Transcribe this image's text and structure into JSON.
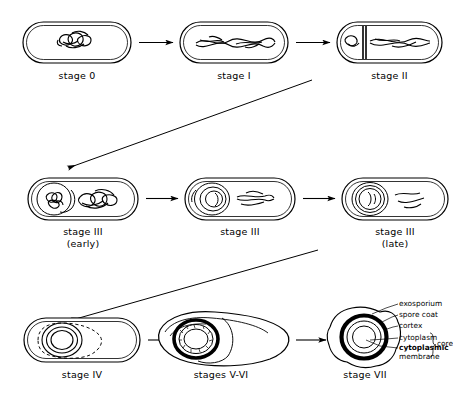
{
  "figure": {
    "background_color": "#ffffff",
    "ink_color": "#000000"
  },
  "rows": [
    {
      "row_id": "row-1",
      "cells": [
        {
          "id": "stage-0",
          "label": "stage 0",
          "roman": "0",
          "sublabel": "",
          "description": "vegetative cell with compact tangled nucleoid"
        },
        {
          "id": "stage-i",
          "label": "stage I",
          "roman": "I",
          "sublabel": "",
          "description": "axial filament of chromatin"
        },
        {
          "id": "stage-ii",
          "label": "stage II",
          "roman": "II",
          "sublabel": "",
          "description": "asymmetric septum formation"
        }
      ]
    },
    {
      "row_id": "row-2",
      "cells": [
        {
          "id": "stage-iii-early",
          "label": "stage III",
          "roman": "III",
          "sublabel": "(early)",
          "description": "engulfment begins, forespore at pole"
        },
        {
          "id": "stage-iii-mid",
          "label": "stage III",
          "roman": "III",
          "sublabel": "",
          "description": "engulfment continuing"
        },
        {
          "id": "stage-iii-late",
          "label": "stage III",
          "roman": "III",
          "sublabel": "(late)",
          "description": "engulfment complete, free forespore"
        }
      ]
    },
    {
      "row_id": "row-3",
      "cells": [
        {
          "id": "stage-iv",
          "label": "stage IV",
          "roman": "IV",
          "sublabel": "",
          "description": "cortex deposition, dashed outline"
        },
        {
          "id": "stages-v-vi",
          "label": "stages V-VI",
          "roman": "V-VI",
          "sublabel": "",
          "description": "coat synthesis and maturation in lysing mother cell"
        },
        {
          "id": "stage-vii",
          "label": "stage VII",
          "roman": "VII",
          "sublabel": "",
          "description": "free mature spore released"
        }
      ]
    }
  ],
  "callouts": {
    "items": [
      {
        "id": "exosporium",
        "text": "exosporium"
      },
      {
        "id": "spore-coat",
        "text": "spore coat"
      },
      {
        "id": "cortex",
        "text": "cortex"
      },
      {
        "id": "cytoplasm",
        "text": "cytoplasm"
      },
      {
        "id": "cytoplasmic-membrane-line1",
        "text": "cytoplasmic"
      },
      {
        "id": "cytoplasmic-membrane-line2",
        "text": "membrane"
      }
    ],
    "brace_group_label": "core"
  },
  "arrows": {
    "horizontal_count": 6,
    "diagonal_count": 2
  }
}
